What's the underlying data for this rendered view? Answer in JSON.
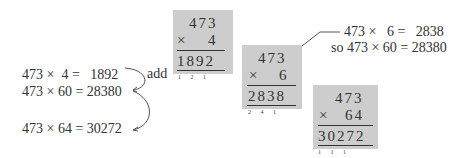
{
  "left_equations": [
    {
      "text": "473 ×  4 =   1892"
    },
    {
      "text": "473 × 60 = 28380"
    },
    {
      "text": "473 × 64 = 30272"
    }
  ],
  "add_label": "add",
  "boxes": [
    {
      "multiplicand": "473",
      "operator": "×",
      "multiplier": "4",
      "product": "1892",
      "carries": "1 2 1"
    },
    {
      "multiplicand": "473",
      "operator": "×",
      "multiplier": "6",
      "product": "2838",
      "carries": "2 4 1"
    },
    {
      "multiplicand": "473",
      "operator": "×",
      "multiplier": "64",
      "product": "30272",
      "carries": "1 1 1"
    }
  ],
  "note": {
    "line1": "473 ×   6 =   2838",
    "line2": "so 473 × 60 = 28380"
  },
  "colors": {
    "box": "#cdcdcd",
    "text": "#333333",
    "arrow": "#555555"
  }
}
